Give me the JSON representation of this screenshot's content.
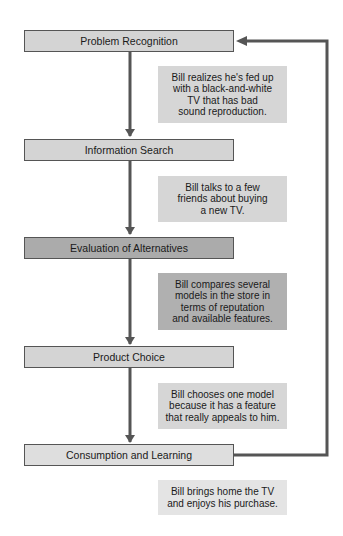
{
  "diagram": {
    "type": "flowchart",
    "stages": [
      {
        "label": "Problem Recognition",
        "tone": "light"
      },
      {
        "label": "Information Search",
        "tone": "light"
      },
      {
        "label": "Evaluation of Alternatives",
        "tone": "dark"
      },
      {
        "label": "Product Choice",
        "tone": "light"
      },
      {
        "label": "Consumption and Learning",
        "tone": "lighter"
      }
    ],
    "notes": [
      {
        "text": "Bill realizes he's fed up\nwith a black-and-white\nTV that has bad\nsound reproduction."
      },
      {
        "text": "Bill talks to a few\nfriends about buying\na new TV."
      },
      {
        "text": "Bill compares several\nmodels in the store in\nterms of reputation\nand available features."
      },
      {
        "text": "Bill chooses one model\nbecause it has a feature\nthat really appeals to him."
      },
      {
        "text": "Bill brings home the TV\nand enjoys his purchase."
      }
    ],
    "connections": [
      {
        "from": "Problem Recognition",
        "to": "Information Search"
      },
      {
        "from": "Information Search",
        "to": "Evaluation of Alternatives"
      },
      {
        "from": "Evaluation of Alternatives",
        "to": "Product Choice"
      },
      {
        "from": "Product Choice",
        "to": "Consumption and Learning"
      },
      {
        "from": "Consumption and Learning",
        "to": "Problem Recognition",
        "kind": "feedback-loop"
      }
    ],
    "colors": {
      "stage_light": "#d4d4d4",
      "stage_dark": "#ababab",
      "stage_lighter": "#dedede",
      "note_light": "#d6d6d6",
      "note_dark": "#b0b0b0",
      "note_lighter": "#e4e4e4",
      "arrow": "#555555"
    }
  }
}
